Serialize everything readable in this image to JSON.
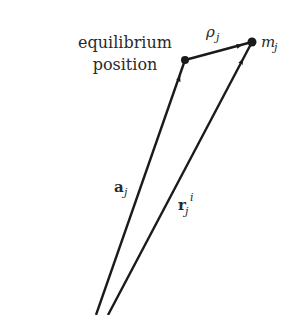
{
  "diagram": {
    "labels": {
      "equilibrium_line1": "equilibrium",
      "equilibrium_line2": "position",
      "rho": "ρ",
      "rho_sub": "j",
      "mass": "m",
      "mass_sub": "j",
      "a_vec": "a",
      "a_sub": "j",
      "r_vec": "r",
      "r_sub": "j",
      "r_sup": "i"
    },
    "colors": {
      "ink": "#1a1a1a",
      "background": "#ffffff"
    },
    "points": {
      "origin_a": [
        96,
        315
      ],
      "origin_r": [
        108,
        315
      ],
      "equilibrium": [
        185,
        60
      ],
      "mass": [
        252,
        42
      ]
    },
    "vectors": [
      {
        "name": "a_j",
        "from": "origin_a",
        "to": "equilibrium"
      },
      {
        "name": "r_j^i",
        "from": "origin_r",
        "to": "mass"
      },
      {
        "name": "rho_j",
        "from": "equilibrium",
        "to": "mass"
      }
    ]
  }
}
